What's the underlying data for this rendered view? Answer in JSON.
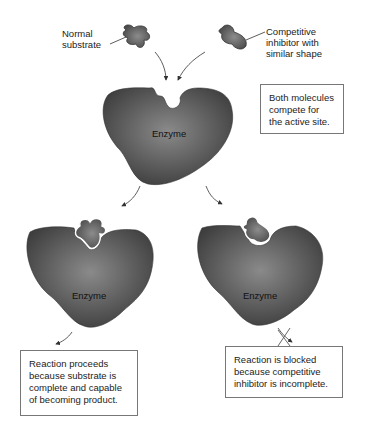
{
  "diagram": {
    "type": "competitive-inhibition",
    "labels": {
      "normal_substrate": "Normal\nsubstrate",
      "competitive_inhibitor": "Competitive\ninhibitor with\nsimilar shape",
      "enzyme_top": "Enzyme",
      "enzyme_left": "Enzyme",
      "enzyme_right": "Enzyme"
    },
    "boxes": {
      "compete": "Both molecules\ncompete for\nthe active site.",
      "proceeds": "Reaction proceeds\nbecause substrate is\ncomplete and capable\nof becoming product.",
      "blocked": "Reaction is blocked\nbecause competitive\ninhibitor is incomplete."
    },
    "colors": {
      "enzyme": "#4a4a4a",
      "enzyme_highlight": "#8a8a8a",
      "molecule": "#5a5a5a",
      "arrow": "#333333",
      "box_border": "#777777"
    }
  }
}
